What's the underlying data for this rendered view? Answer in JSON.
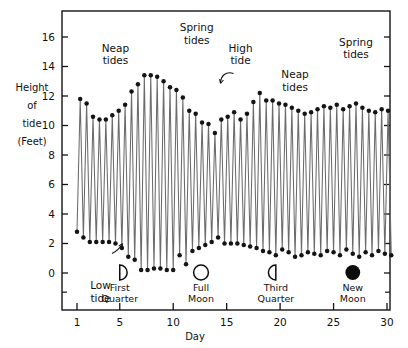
{
  "chart_data": {
    "type": "line",
    "title": "",
    "xlabel": "Day",
    "ylabel": "Height of tide (Feet)",
    "ylabel_lines": [
      "Height",
      "of",
      "tide",
      "(Feet)"
    ],
    "xlim": [
      0.6,
      30.6
    ],
    "ylim": [
      -0.6,
      17.4
    ],
    "grid": false,
    "legend": "none",
    "xticks": [
      1,
      5,
      10,
      15,
      20,
      25,
      30
    ],
    "xtick_labels": [
      "1",
      "5",
      "10",
      "15",
      "20",
      "25",
      "30"
    ],
    "yticks": [
      0,
      2,
      4,
      6,
      8,
      10,
      12,
      14,
      16
    ],
    "ytick_labels": [
      "0",
      "2",
      "4",
      "6",
      "8",
      "10",
      "12",
      "14",
      "16"
    ],
    "marker": "filled-circle",
    "series": [
      {
        "name": "Tide height",
        "x": [
          1.0,
          1.3,
          1.6,
          1.9,
          2.2,
          2.5,
          2.8,
          3.1,
          3.4,
          3.7,
          4.0,
          4.3,
          4.6,
          4.9,
          5.2,
          5.5,
          5.8,
          6.1,
          6.4,
          6.7,
          7.0,
          7.3,
          7.6,
          7.9,
          8.2,
          8.5,
          8.8,
          9.1,
          9.4,
          9.7,
          10.0,
          10.3,
          10.6,
          10.9,
          11.2,
          11.5,
          11.8,
          12.1,
          12.4,
          12.7,
          13.0,
          13.3,
          13.6,
          13.9,
          14.2,
          14.5,
          14.8,
          15.1,
          15.4,
          15.7,
          16.0,
          16.3,
          16.6,
          16.9,
          17.2,
          17.5,
          17.8,
          18.1,
          18.4,
          18.7,
          19.0,
          19.3,
          19.6,
          19.9,
          20.2,
          20.5,
          20.8,
          21.1,
          21.4,
          21.7,
          22.0,
          22.3,
          22.6,
          22.9,
          23.2,
          23.5,
          23.8,
          24.1,
          24.4,
          24.7,
          25.0,
          25.3,
          25.6,
          25.9,
          26.2,
          26.5,
          26.8,
          27.1,
          27.4,
          27.7,
          28.0,
          28.3,
          28.6,
          28.9,
          29.2,
          29.5,
          29.8,
          30.1,
          30.4
        ],
        "y": [
          2.8,
          11.8,
          2.4,
          11.5,
          2.1,
          10.6,
          2.1,
          10.4,
          2.1,
          10.4,
          2.1,
          10.7,
          2.0,
          11.0,
          1.7,
          11.4,
          1.1,
          12.3,
          0.9,
          12.8,
          0.2,
          13.4,
          0.2,
          13.4,
          0.3,
          13.3,
          0.3,
          13.0,
          0.2,
          12.6,
          0.2,
          12.4,
          1.2,
          11.9,
          0.6,
          11.0,
          1.5,
          10.8,
          1.7,
          10.2,
          1.9,
          10.1,
          2.1,
          9.5,
          2.4,
          10.4,
          2.0,
          10.6,
          2.0,
          10.9,
          2.0,
          10.4,
          1.9,
          10.8,
          1.8,
          11.6,
          1.7,
          12.2,
          1.5,
          11.7,
          1.4,
          11.7,
          1.2,
          11.5,
          1.6,
          11.4,
          1.4,
          11.2,
          1.1,
          11.0,
          1.2,
          10.8,
          1.4,
          10.9,
          1.3,
          11.1,
          1.2,
          11.3,
          1.5,
          11.2,
          1.4,
          11.4,
          1.2,
          11.1,
          1.6,
          11.3,
          1.3,
          11.5,
          1.1,
          11.2,
          1.4,
          11.0,
          1.2,
          10.9,
          1.5,
          11.1,
          1.3,
          11.0,
          1.2
        ]
      }
    ],
    "annotations": [
      {
        "id": "neap-tides-1",
        "text": "Neap tides",
        "lines": [
          "Neap",
          "tides"
        ],
        "x": 4.6,
        "y": 15.0
      },
      {
        "id": "spring-tides-1",
        "text": "Spring tides",
        "lines": [
          "Spring",
          "tides"
        ],
        "x": 12.2,
        "y": 16.4
      },
      {
        "id": "high-tide",
        "text": "High tide",
        "lines": [
          "High",
          "tide"
        ],
        "x": 16.3,
        "y": 15.0,
        "leader": "curved-arrow-to-peak"
      },
      {
        "id": "neap-tides-2",
        "text": "Neap tides",
        "lines": [
          "Neap",
          "tides"
        ],
        "x": 21.4,
        "y": 13.2
      },
      {
        "id": "spring-tides-2",
        "text": "Spring tides",
        "lines": [
          "Spring",
          "tides"
        ],
        "x": 27.1,
        "y": 15.4
      },
      {
        "id": "low-tide",
        "text": "Low tide",
        "lines": [
          "Low",
          "tide"
        ],
        "x": 3.2,
        "y": -1.1,
        "leader": "curved-arrow-to-trough"
      }
    ],
    "moon_phases": [
      {
        "id": "first-quarter",
        "label": "First Quarter",
        "lines": [
          "First",
          "Quarter"
        ],
        "day": 5.0,
        "glyph": "right-half-lit-outline"
      },
      {
        "id": "full-moon",
        "label": "Full Moon",
        "lines": [
          "Full",
          "Moon"
        ],
        "day": 12.6,
        "glyph": "open-circle"
      },
      {
        "id": "third-quarter",
        "label": "Third Quarter",
        "lines": [
          "Third",
          "Quarter"
        ],
        "day": 19.6,
        "glyph": "left-half-lit-outline"
      },
      {
        "id": "new-moon",
        "label": "New Moon",
        "lines": [
          "New",
          "Moon"
        ],
        "day": 26.8,
        "glyph": "filled-circle"
      }
    ],
    "colors": {
      "line": "#6b6b6b",
      "marker": "#141414",
      "axis": "#141414",
      "text": "#111111",
      "background": "#ffffff"
    }
  }
}
